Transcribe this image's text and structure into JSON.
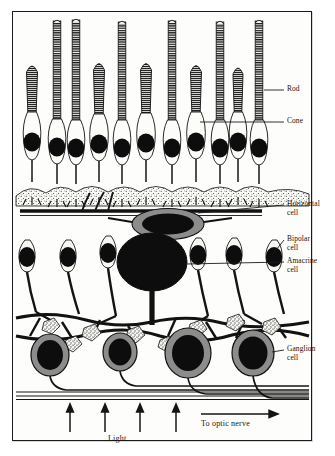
{
  "figure": {
    "background": "#fdfdfb",
    "ink": "#17130f",
    "gray_soma": "#8c8c8c",
    "nucleus": "#0d0d0d"
  },
  "labels": {
    "rod": "Rod",
    "cone": "Cone",
    "horizontal_cell": "Horizontal\ncell",
    "bipolar_cell": "Bipolar\ncell",
    "amacrine_cell": "Amacrine\ncell",
    "ganglion_cell": "Ganglion\ncell"
  },
  "annotations": {
    "light": "Light",
    "optic_nerve": "To optic nerve"
  },
  "layers": [
    {
      "name": "outer-segment-layer",
      "cells": "rods and cones"
    },
    {
      "name": "outer-nuclear-layer",
      "cells": "photoreceptor somata"
    },
    {
      "name": "outer-plexiform-layer",
      "cells": "photoreceptor terminals, horizontal cell"
    },
    {
      "name": "inner-nuclear-layer",
      "cells": "bipolar and amacrine cells"
    },
    {
      "name": "inner-plexiform-layer",
      "cells": "bipolar-amacrine-ganglion synapses"
    },
    {
      "name": "ganglion-cell-layer",
      "cells": "ganglion cells"
    },
    {
      "name": "nerve-fiber-layer",
      "cells": "ganglion axons"
    }
  ],
  "photoreceptors": [
    {
      "type": "cone",
      "x": 32
    },
    {
      "type": "rod",
      "x": 57
    },
    {
      "type": "rod",
      "x": 76
    },
    {
      "type": "cone",
      "x": 99
    },
    {
      "type": "rod",
      "x": 122
    },
    {
      "type": "cone",
      "x": 146
    },
    {
      "type": "rod",
      "x": 172
    },
    {
      "type": "cone",
      "x": 196
    },
    {
      "type": "rod",
      "x": 220
    },
    {
      "type": "cone",
      "x": 238
    },
    {
      "type": "rod",
      "x": 259
    }
  ],
  "light_arrows": [
    70,
    105,
    140,
    176
  ],
  "counts": {
    "rods": 5,
    "cones": 5,
    "bipolar_cells": 6,
    "ganglion_cells": 4,
    "light_arrows": 4
  }
}
